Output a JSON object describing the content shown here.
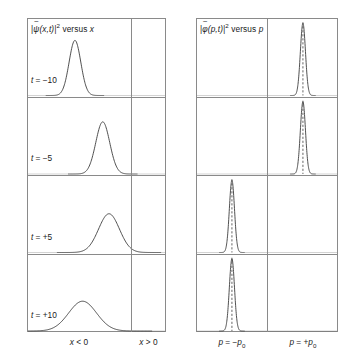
{
  "figure": {
    "background": "#ffffff",
    "line_color": "#8a8a8a",
    "curve_color": "#3c3c3c",
    "dash_color": "#555555",
    "width": 353,
    "height": 362
  },
  "left_panel": {
    "name": "position-space-panel",
    "title_prefix": "|",
    "title_symbol": "ψ",
    "title_tilde": "~",
    "title_args": "(x,t)|",
    "title_exp": "2",
    "title_suffix": " versus ",
    "title_var": "x",
    "title_full": "|ψ̃(x,t)|² versus x",
    "geometry": {
      "x": 27,
      "y": 18,
      "width": 139,
      "height": 314,
      "divider_x_frac": 0.748
    },
    "axis_labels": [
      {
        "text_var": "x",
        "text_rel": " < 0",
        "full": "x < 0",
        "center_frac": 0.374
      },
      {
        "text_var": "x",
        "text_rel": " > 0",
        "full": "x > 0",
        "center_frac": 0.874
      }
    ],
    "rows": [
      {
        "time_label_var": "t",
        "time_label_value": " = −10",
        "time_full": "t = −10",
        "peak_center_frac": 0.345,
        "peak_sigma_frac": 0.042,
        "peak_height_frac": 0.74
      },
      {
        "time_label_var": "t",
        "time_label_value": " = −5",
        "time_full": "t = −5",
        "peak_center_frac": 0.545,
        "peak_sigma_frac": 0.05,
        "peak_height_frac": 0.7
      },
      {
        "time_label_var": "t",
        "time_label_value": " = +5",
        "time_full": "t = +5",
        "peak_center_frac": 0.59,
        "peak_sigma_frac": 0.075,
        "peak_height_frac": 0.52
      },
      {
        "time_label_var": "t",
        "time_label_value": " = +10",
        "time_full": "t = +10",
        "peak_center_frac": 0.4,
        "peak_sigma_frac": 0.1,
        "peak_height_frac": 0.4
      }
    ]
  },
  "right_panel": {
    "name": "momentum-space-panel",
    "title_prefix": "|",
    "title_symbol": "φ",
    "title_tilde": "~",
    "title_args": "(p,t)|",
    "title_exp": "2",
    "title_suffix": " versus ",
    "title_var": "p",
    "title_full": "|φ̃(p,t)|² versus p",
    "geometry": {
      "x": 196,
      "y": 18,
      "width": 142,
      "height": 314,
      "divider_x_frac": 0.5
    },
    "axis_labels": [
      {
        "full": "p = −p₀",
        "var": "p",
        "rel": " = −",
        "sym": "p",
        "sub": "0",
        "center_frac": 0.253
      },
      {
        "full": "p = +p₀",
        "var": "p",
        "rel": " = +",
        "sym": "p",
        "sub": "0",
        "center_frac": 0.753
      }
    ],
    "rows": [
      {
        "peak_center_frac": 0.753,
        "peak_sigma_frac": 0.018,
        "peak_height_frac": 0.97,
        "dashed_center": true
      },
      {
        "peak_center_frac": 0.753,
        "peak_sigma_frac": 0.018,
        "peak_height_frac": 0.97,
        "dashed_center": true
      },
      {
        "peak_center_frac": 0.253,
        "peak_sigma_frac": 0.018,
        "peak_height_frac": 0.97,
        "dashed_center": true
      },
      {
        "peak_center_frac": 0.253,
        "peak_sigma_frac": 0.018,
        "peak_height_frac": 0.97,
        "dashed_center": true
      }
    ]
  },
  "chart_data": {
    "type": "line",
    "panels": [
      {
        "name": "position",
        "title": "|ψ̃(x,t)|² versus x",
        "xlabel": "x",
        "ylabel": "|ψ̃(x,t)|²",
        "xtick_labels": [
          "x < 0",
          "x > 0"
        ],
        "grid": false,
        "legend": "none",
        "series": [
          {
            "name": "t = −10",
            "peak_x": -0.55,
            "width_sigma": 0.17,
            "peak_height": 0.74
          },
          {
            "name": "t = −5",
            "peak_x": -0.26,
            "width_sigma": 0.2,
            "peak_height": 0.7
          },
          {
            "name": "t = +5",
            "peak_x": -0.2,
            "width_sigma": 0.3,
            "peak_height": 0.52
          },
          {
            "name": "t = +10",
            "peak_x": -0.47,
            "width_sigma": 0.4,
            "peak_height": 0.4
          }
        ]
      },
      {
        "name": "momentum",
        "title": "|φ̃(p,t)|² versus p",
        "xlabel": "p",
        "ylabel": "|φ̃(p,t)|²",
        "xtick_labels": [
          "p = −p₀",
          "p = +p₀"
        ],
        "grid": false,
        "legend": "none",
        "series": [
          {
            "name": "t = −10",
            "peak_p": 1.0,
            "width_sigma": 0.072,
            "peak_height": 0.97
          },
          {
            "name": "t = −5",
            "peak_p": 1.0,
            "width_sigma": 0.072,
            "peak_height": 0.97
          },
          {
            "name": "t = +5",
            "peak_p": -1.0,
            "width_sigma": 0.072,
            "peak_height": 0.97
          },
          {
            "name": "t = +10",
            "peak_p": -1.0,
            "width_sigma": 0.072,
            "peak_height": 0.97
          }
        ]
      }
    ]
  }
}
